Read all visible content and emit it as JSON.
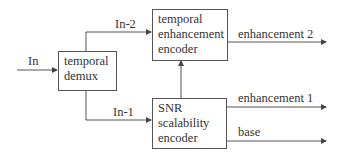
{
  "diagram": {
    "type": "block-diagram",
    "colors": {
      "line": "#555555",
      "text": "#333333",
      "background": "#ffffff"
    },
    "nodes": {
      "demux": {
        "lines": [
          "temporal",
          "demux"
        ]
      },
      "temporal_encoder": {
        "lines": [
          "temporal",
          "enhancement",
          "encoder"
        ]
      },
      "snr_encoder": {
        "lines": [
          "SNR",
          "scalability",
          "encoder"
        ]
      }
    },
    "edges": {
      "input": {
        "label": "In"
      },
      "to_temporal": {
        "label": "In-2"
      },
      "to_snr": {
        "label": "In-1"
      },
      "out_enh2": {
        "label": "enhancement 2"
      },
      "out_enh1": {
        "label": "enhancement 1"
      },
      "out_base": {
        "label": "base"
      }
    }
  }
}
